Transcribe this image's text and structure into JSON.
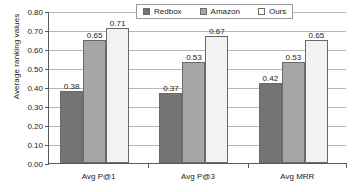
{
  "chart_data": {
    "type": "bar",
    "title": "",
    "xlabel": "",
    "ylabel": "Average ranking values",
    "categories": [
      "Avg P@1",
      "Avg P@3",
      "Avg MRR"
    ],
    "series": [
      {
        "name": "Redbox",
        "values": [
          0.38,
          0.37,
          0.42
        ],
        "color": "#747474"
      },
      {
        "name": "Amazon",
        "values": [
          0.65,
          0.53,
          0.53
        ],
        "color": "#a6a6a6"
      },
      {
        "name": "Ours",
        "values": [
          0.71,
          0.67,
          0.65
        ],
        "color": "#f2f2f2"
      }
    ],
    "value_labels": [
      [
        "0.38",
        "0.65",
        "0.71"
      ],
      [
        "0.37",
        "0.53",
        "0.67"
      ],
      [
        "0.42",
        "0.53",
        "0.65"
      ]
    ],
    "ylim": [
      0.0,
      0.8
    ],
    "ytick_values": [
      0.8,
      0.7,
      0.6,
      0.5,
      0.4,
      0.3,
      0.2,
      0.1,
      0.0
    ],
    "ytick_labels": [
      "0.80",
      "0.70",
      "0.60",
      "0.50",
      "0.40",
      "0.30",
      "0.20",
      "0.10",
      "0.00"
    ],
    "grid": true,
    "legend_position": "top-right",
    "legend_entries": [
      "Redbox",
      "Amazon",
      "Ours"
    ]
  }
}
